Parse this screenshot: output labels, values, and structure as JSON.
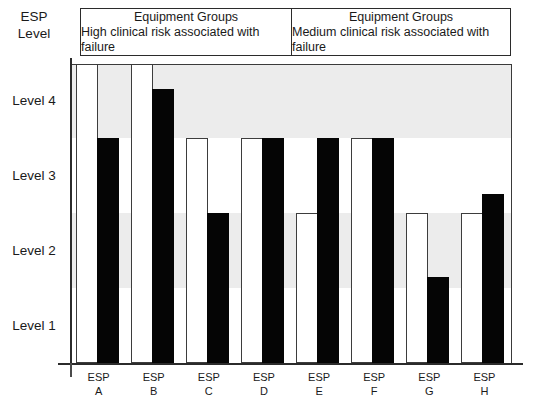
{
  "axis_caption": {
    "line1": "ESP",
    "line2": "Level"
  },
  "groups": [
    {
      "title": "Equipment Groups",
      "subtitle": "High clinical risk associated with failure"
    },
    {
      "title": "Equipment Groups",
      "subtitle": "Medium clinical risk associated with failure"
    }
  ],
  "chart_data": {
    "type": "bar",
    "title": "",
    "xlabel": "",
    "ylabel": "ESP Level",
    "ylim": [
      0,
      4
    ],
    "grid": false,
    "legend_position": "none",
    "categories": [
      "ESP A",
      "ESP B",
      "ESP C",
      "ESP D",
      "ESP E",
      "ESP F",
      "ESP G",
      "ESP H"
    ],
    "category_lines": [
      {
        "t1": "ESP",
        "t2": "A"
      },
      {
        "t1": "ESP",
        "t2": "B"
      },
      {
        "t1": "ESP",
        "t2": "C"
      },
      {
        "t1": "ESP",
        "t2": "D"
      },
      {
        "t1": "ESP",
        "t2": "E"
      },
      {
        "t1": "ESP",
        "t2": "F"
      },
      {
        "t1": "ESP",
        "t2": "G"
      },
      {
        "t1": "ESP",
        "t2": "H"
      }
    ],
    "series": [
      {
        "name": "white",
        "color": "#ffffff",
        "values": [
          4.0,
          4.0,
          3.0,
          3.0,
          2.0,
          3.0,
          2.0,
          2.0
        ]
      },
      {
        "name": "black",
        "color": "#050505",
        "values": [
          3.0,
          3.65,
          2.0,
          3.0,
          3.0,
          3.0,
          1.15,
          2.25
        ]
      }
    ],
    "ytick_labels": [
      "Level 1",
      "Level 2",
      "Level 3",
      "Level 4"
    ],
    "ytick_values": [
      0.5,
      1.5,
      2.5,
      3.5
    ],
    "bands": [
      {
        "from": 0.0,
        "to": 1.0,
        "shaded": false
      },
      {
        "from": 1.0,
        "to": 2.0,
        "shaded": true
      },
      {
        "from": 2.0,
        "to": 3.0,
        "shaded": false
      },
      {
        "from": 3.0,
        "to": 4.0,
        "shaded": true
      }
    ],
    "group_split_after_category": 4
  },
  "colors": {
    "bar_black": "#050505",
    "bar_white": "#ffffff",
    "band_shade": "#ececec",
    "outline": "#3d3d3d"
  }
}
